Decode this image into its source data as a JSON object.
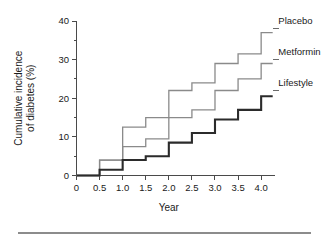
{
  "chart_data": {
    "type": "line",
    "subtype": "step",
    "title": "",
    "xlabel": "Year",
    "ylabel": "Cumulative incidence of diabetes (%)",
    "ylabel_line1": "Cumulative incidence",
    "ylabel_line2": "of diabetes (%)",
    "x": [
      0,
      0.5,
      1.0,
      1.5,
      2.0,
      2.5,
      3.0,
      3.5,
      4.0
    ],
    "xlim": [
      0,
      4.3
    ],
    "ylim": [
      0,
      40
    ],
    "xticks": [
      0,
      0.5,
      1.0,
      1.5,
      2.0,
      2.5,
      3.0,
      3.5,
      4.0
    ],
    "xtick_labels": [
      "0",
      "0.5",
      "1.0",
      "1.5",
      "2.0",
      "2.5",
      "3.0",
      "3.5",
      "4.0"
    ],
    "yticks": [
      0,
      10,
      20,
      30,
      40
    ],
    "ytick_labels": [
      "0",
      "10",
      "20",
      "30",
      "40"
    ],
    "yticks_minor": [
      5,
      15,
      25,
      35
    ],
    "grid": false,
    "legend_position": "inline-right-of-curve-ends",
    "series": [
      {
        "name": "Placebo",
        "color": "#8a8a8a",
        "line_width": 1.3,
        "values": [
          0,
          4,
          12.5,
          15,
          22,
          24,
          29,
          31.5,
          37
        ],
        "label_x": 4.35,
        "label_y": 38.5
      },
      {
        "name": "Metformin",
        "color": "#8a8a8a",
        "line_width": 1.3,
        "values": [
          0,
          4,
          7.5,
          9.5,
          15,
          17,
          22,
          25,
          29
        ],
        "label_x": 4.35,
        "label_y": 30.5
      },
      {
        "name": "Lifestyle",
        "color": "#2b2b2b",
        "line_width": 2.1,
        "values": [
          0,
          1.5,
          4,
          5,
          8.5,
          11,
          14.5,
          17,
          20.5
        ],
        "label_x": 4.35,
        "label_y": 22.5
      }
    ]
  },
  "figure": {
    "footer_rule": true
  }
}
